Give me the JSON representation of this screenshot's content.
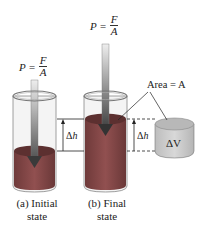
{
  "diagram": {
    "formula_a": {
      "lhs": "P =",
      "numerator": "F",
      "denominator": "A"
    },
    "formula_b": {
      "lhs": "P =",
      "numerator": "F",
      "denominator": "A"
    },
    "area_label": "Area = A",
    "delta_h_left": {
      "delta": "Δ",
      "var": "h"
    },
    "delta_h_right": {
      "delta": "Δ",
      "var": "h"
    },
    "delta_v_label": "ΔV",
    "caption_a": {
      "line1": "(a) Initial",
      "line2": "state"
    },
    "caption_b": {
      "line1": "(b) Final",
      "line2": "state"
    },
    "colors": {
      "liquid_side": "#8a4a4a",
      "liquid_top": "#5e3434",
      "glass": "#f2f2f2",
      "glass_edge": "#777777",
      "arrow_light": "#e6e6e6",
      "arrow_dark": "#5a5a5a",
      "delta_v_body": "#cccccc",
      "delta_v_top": "#b9b9b9"
    }
  }
}
